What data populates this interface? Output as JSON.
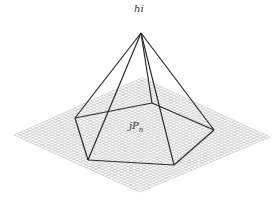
{
  "diagram": {
    "type": "pyramid-over-grid-plane",
    "apex_label": "hi",
    "base_label": "P",
    "base_label_subscript": "n",
    "base_label_prefix": "j",
    "colors": {
      "edge": "#2a2a2a",
      "grid": "#bdbdbd",
      "background": "#ffffff",
      "text": "#333333"
    },
    "apex": [
      141,
      33
    ],
    "base_vertices": [
      [
        75,
        118
      ],
      [
        88,
        160
      ],
      [
        174,
        165
      ],
      [
        214,
        130
      ],
      [
        152,
        103
      ]
    ],
    "grid_plane_corners": [
      [
        142,
        78
      ],
      [
        270,
        137
      ],
      [
        140,
        192
      ],
      [
        14,
        135
      ]
    ],
    "grid_divisions": 40
  }
}
